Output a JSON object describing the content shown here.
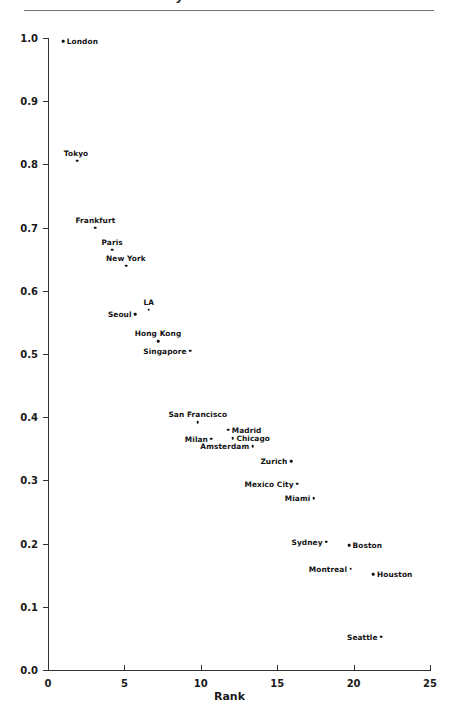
{
  "header": {
    "title_clipped": "Market Share by Rank",
    "rule_visible": true
  },
  "chart_data": {
    "type": "scatter",
    "title": "",
    "xlabel": "Rank",
    "ylabel": "",
    "xlim": [
      0,
      25
    ],
    "ylim": [
      0.0,
      1.0
    ],
    "xticks": [
      "0",
      "5",
      "10",
      "15",
      "20",
      "25"
    ],
    "xtick_values": [
      0,
      5,
      10,
      15,
      20,
      25
    ],
    "yticks": [
      "0.0",
      "0.1",
      "0.2",
      "0.3",
      "0.4",
      "0.5",
      "0.6",
      "0.7",
      "0.8",
      "0.9",
      "1.0"
    ],
    "ytick_values": [
      0.0,
      0.1,
      0.2,
      0.3,
      0.4,
      0.5,
      0.6,
      0.7,
      0.8,
      0.9,
      1.0
    ],
    "grid": false,
    "legend": "none",
    "marker_color": "#111111",
    "points": [
      {
        "label": "London",
        "x": 1.0,
        "y": 0.995,
        "pos": "right"
      },
      {
        "label": "Tokyo",
        "x": 1.9,
        "y": 0.806,
        "pos": "left-above"
      },
      {
        "label": "Frankfurt",
        "x": 3.1,
        "y": 0.7,
        "pos": "above"
      },
      {
        "label": "Paris",
        "x": 4.2,
        "y": 0.665,
        "pos": "above"
      },
      {
        "label": "New York",
        "x": 5.1,
        "y": 0.64,
        "pos": "above"
      },
      {
        "label": "LA",
        "x": 6.6,
        "y": 0.57,
        "pos": "above"
      },
      {
        "label": "Seoul",
        "x": 5.7,
        "y": 0.563,
        "pos": "left"
      },
      {
        "label": "Hong Kong",
        "x": 7.2,
        "y": 0.52,
        "pos": "above"
      },
      {
        "label": "Singapore",
        "x": 9.3,
        "y": 0.505,
        "pos": "left"
      },
      {
        "label": "San Francisco",
        "x": 9.8,
        "y": 0.392,
        "pos": "above"
      },
      {
        "label": "Madrid",
        "x": 11.8,
        "y": 0.38,
        "pos": "right"
      },
      {
        "label": "Chicago",
        "x": 12.1,
        "y": 0.367,
        "pos": "right"
      },
      {
        "label": "Milan",
        "x": 10.7,
        "y": 0.366,
        "pos": "left"
      },
      {
        "label": "Amsterdam",
        "x": 13.4,
        "y": 0.354,
        "pos": "left"
      },
      {
        "label": "Zurich",
        "x": 15.9,
        "y": 0.33,
        "pos": "left"
      },
      {
        "label": "Mexico City",
        "x": 16.3,
        "y": 0.295,
        "pos": "left"
      },
      {
        "label": "Miami",
        "x": 17.4,
        "y": 0.272,
        "pos": "left"
      },
      {
        "label": "Sydney",
        "x": 18.2,
        "y": 0.203,
        "pos": "left"
      },
      {
        "label": "Boston",
        "x": 19.7,
        "y": 0.197,
        "pos": "right"
      },
      {
        "label": "Montreal",
        "x": 19.8,
        "y": 0.16,
        "pos": "left"
      },
      {
        "label": "Houston",
        "x": 21.3,
        "y": 0.152,
        "pos": "right"
      },
      {
        "label": "Seattle",
        "x": 21.8,
        "y": 0.053,
        "pos": "left"
      }
    ]
  }
}
